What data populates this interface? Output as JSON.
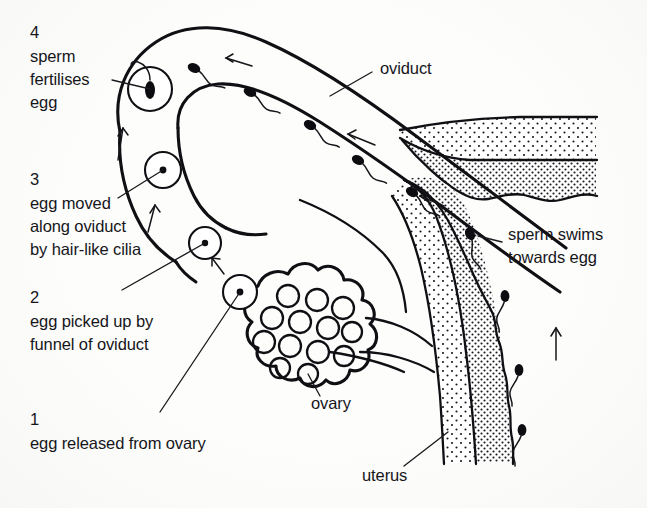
{
  "figure": {
    "background_color": "#fdfdfc",
    "ink_color": "#101014"
  },
  "steps": [
    {
      "number": "4",
      "lines": [
        "sperm",
        "fertilises",
        "egg"
      ],
      "x": 30,
      "y": 28,
      "has_leader": true
    },
    {
      "number": "3",
      "lines": [
        "egg moved",
        "along oviduct",
        "by hair-like cilia"
      ],
      "x": 30,
      "y": 175,
      "has_leader": true
    },
    {
      "number": "2",
      "lines": [
        "egg picked up by",
        "funnel of oviduct"
      ],
      "x": 30,
      "y": 293,
      "has_leader": true
    },
    {
      "number": "1",
      "lines": [
        "egg released from ovary"
      ],
      "x": 30,
      "y": 415,
      "has_leader": true
    }
  ],
  "part_labels": [
    {
      "name": "oviduct",
      "text": "oviduct",
      "x": 380,
      "y": 68,
      "anchor": "start",
      "has_leader": true
    },
    {
      "name": "sperm-swims",
      "text_lines": [
        "sperm swims",
        "towards egg"
      ],
      "x": 508,
      "y": 245,
      "anchor": "start",
      "has_leader": true
    },
    {
      "name": "ovary",
      "text": "ovary",
      "x": 311,
      "y": 403,
      "anchor": "start",
      "has_leader": true
    },
    {
      "name": "uterus",
      "text": "uterus",
      "x": 362,
      "y": 475,
      "anchor": "start",
      "has_leader": true
    }
  ],
  "eggs": [
    {
      "name": "egg-fertilised",
      "cx": 150,
      "cy": 89,
      "r": 22,
      "state": "sperm-entering"
    },
    {
      "name": "egg-in-oviduct",
      "cx": 163,
      "cy": 170,
      "r": 18,
      "state": "plain"
    },
    {
      "name": "egg-at-funnel",
      "cx": 205,
      "cy": 243,
      "r": 16,
      "state": "plain"
    },
    {
      "name": "egg-released",
      "cx": 240,
      "cy": 292,
      "r": 17,
      "state": "plain"
    }
  ],
  "sperm": [
    {
      "name": "sperm-oviduct-1",
      "x": 194,
      "y": 68,
      "angle": 22
    },
    {
      "name": "sperm-oviduct-2",
      "x": 250,
      "y": 92,
      "angle": 24
    },
    {
      "name": "sperm-oviduct-3",
      "x": 310,
      "y": 125,
      "angle": 26
    },
    {
      "name": "sperm-oviduct-4",
      "x": 358,
      "y": 160,
      "angle": 28
    },
    {
      "name": "sperm-oviduct-5",
      "x": 412,
      "y": 192,
      "angle": 30
    },
    {
      "name": "sperm-junction",
      "x": 470,
      "y": 234,
      "angle": 40
    },
    {
      "name": "sperm-uterus-1",
      "x": 505,
      "y": 296,
      "angle": 80
    },
    {
      "name": "sperm-vagina-1",
      "x": 519,
      "y": 370,
      "angle": 84
    },
    {
      "name": "sperm-vagina-2",
      "x": 522,
      "y": 430,
      "angle": 84
    }
  ],
  "direction_arrows": [
    {
      "name": "arrow-oviduct-flow-1",
      "x1": 252,
      "y1": 66,
      "x2": 226,
      "y2": 58
    },
    {
      "name": "arrow-oviduct-flow-2",
      "x1": 375,
      "y1": 145,
      "x2": 348,
      "y2": 134
    },
    {
      "name": "arrow-oviduct-flow-3",
      "x1": 444,
      "y1": 206,
      "x2": 420,
      "y2": 196
    },
    {
      "name": "arrow-egg-up-1",
      "x1": 118,
      "y1": 160,
      "x2": 123,
      "y2": 128
    },
    {
      "name": "arrow-egg-up-2",
      "x1": 148,
      "y1": 232,
      "x2": 155,
      "y2": 205
    },
    {
      "name": "arrow-egg-up-3",
      "x1": 222,
      "y1": 272,
      "x2": 212,
      "y2": 258
    },
    {
      "name": "arrow-sperm-up-uterus",
      "x1": 556,
      "y1": 358,
      "x2": 556,
      "y2": 328
    }
  ],
  "ovary": {
    "name": "ovary",
    "cx": 277,
    "cy": 332,
    "follicle_count": 13
  },
  "caption": {
    "text": "",
    "note": "bottom caption cropped off by image edge"
  }
}
